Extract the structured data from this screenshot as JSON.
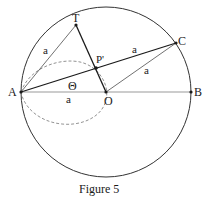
{
  "figure": {
    "caption": "Figure 5",
    "points": {
      "A": {
        "label": "A",
        "x": 21,
        "y": 92
      },
      "B": {
        "label": "B",
        "x": 191,
        "y": 92
      },
      "O": {
        "label": "O",
        "x": 106,
        "y": 92
      },
      "T": {
        "label": "T",
        "x": 76,
        "y": 25
      },
      "C": {
        "label": "C",
        "x": 176,
        "y": 43
      },
      "P": {
        "label": "P'",
        "x": 96,
        "y": 68
      }
    },
    "segment_labels": {
      "AT": "a",
      "PC": "a",
      "OC": "a",
      "AO": "a"
    },
    "angle_label": "Θ",
    "colors": {
      "stroke": "#1a1a1a",
      "thin": "#333333",
      "dashed": "#777777"
    }
  }
}
